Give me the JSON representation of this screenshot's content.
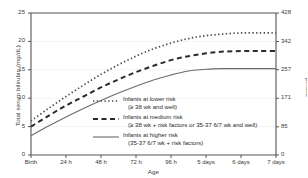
{
  "chart_data": {
    "type": "line",
    "title": "",
    "xlabel": "Age",
    "ylabel": "Total serum bilirubin (mg/dL)",
    "ylabel_right": "μmol/L",
    "xlim": [
      0,
      168
    ],
    "ylim": [
      0,
      25
    ],
    "ylim_right": [
      0,
      428
    ],
    "grid": true,
    "legend_position": "inside-center-right",
    "x_tick_labels": [
      "Birth",
      "24 h",
      "48 h",
      "72 h",
      "96 h",
      "5 days",
      "6 days",
      "7 days"
    ],
    "x_tick_values": [
      0,
      24,
      48,
      72,
      96,
      120,
      144,
      168
    ],
    "y_tick_labels": [
      "0",
      "5",
      "10",
      "15",
      "20",
      "25"
    ],
    "y_tick_values": [
      0,
      5,
      10,
      15,
      20,
      25
    ],
    "y_tick_labels_right": [
      "0",
      "85",
      "171",
      "257",
      "342",
      "428"
    ],
    "y_tick_values_right": [
      0,
      85,
      171,
      257,
      342,
      428
    ],
    "x": [
      0,
      12,
      24,
      36,
      48,
      60,
      72,
      84,
      96,
      108,
      120,
      132,
      144,
      156,
      168
    ],
    "series": [
      {
        "name": "Infants at lower risk",
        "sublabel": "(≥ 38 wk and well)",
        "style": "dotted",
        "color": "#4a4a4a",
        "values": [
          6.0,
          8.2,
          10.3,
          12.3,
          14.2,
          15.9,
          17.4,
          18.7,
          19.7,
          20.5,
          21.0,
          21.3,
          21.5,
          21.5,
          21.5
        ]
      },
      {
        "name": "Infants at medium risk",
        "sublabel": "(≥ 38 wk + risk factors or 35-37 6/7 wk and well)",
        "style": "dashed",
        "color": "#2b2b2b",
        "values": [
          5.0,
          6.9,
          8.7,
          10.3,
          11.9,
          13.3,
          14.6,
          15.7,
          16.7,
          17.4,
          17.9,
          18.2,
          18.3,
          18.3,
          18.3
        ]
      },
      {
        "name": "Infants at higher risk",
        "sublabel": "(35-37 6/7 wk + risk factors)",
        "style": "solid",
        "color": "#6b6b6b",
        "values": [
          3.4,
          5.1,
          6.7,
          8.2,
          9.6,
          10.9,
          12.1,
          13.2,
          14.1,
          14.8,
          15.1,
          15.2,
          15.2,
          15.2,
          15.2
        ]
      }
    ]
  },
  "colors": {
    "axis": "#555555",
    "grid": "#efefef",
    "text": "#2b2b2b",
    "lower_risk": "#4a4a4a",
    "medium_risk": "#2b2b2b",
    "higher_risk": "#6b6b6b"
  }
}
